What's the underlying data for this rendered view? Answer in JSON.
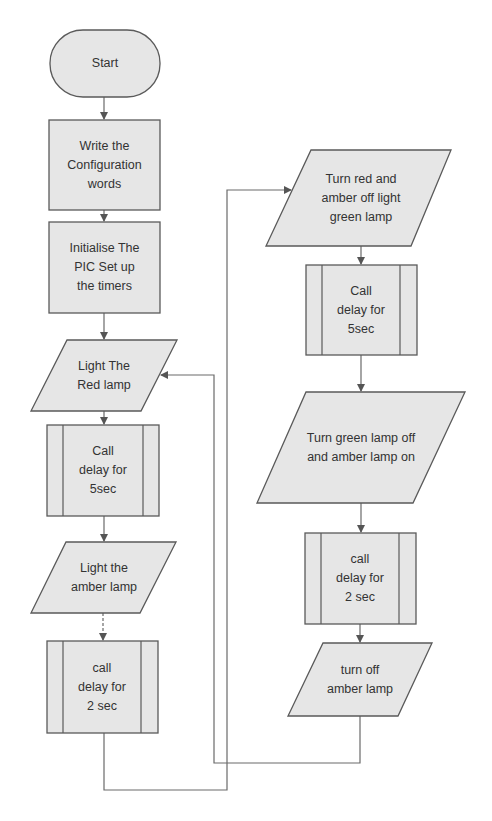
{
  "diagram": {
    "type": "flowchart",
    "colors": {
      "node_fill": "#e6e6e6",
      "node_stroke": "#5a5a5a",
      "connector": "#6a6a6a",
      "text": "#333333",
      "background": "#ffffff"
    },
    "nodes": {
      "start": {
        "shape": "terminal",
        "label": "Start"
      },
      "write_config": {
        "shape": "process",
        "label": "Write the\nConfiguration\nwords"
      },
      "init_pic": {
        "shape": "process",
        "label": "Initialise The\nPIC Set up\nthe timers"
      },
      "light_red": {
        "shape": "io",
        "label": "Light The\nRed lamp"
      },
      "delay_5_left": {
        "shape": "subroutine",
        "label": "Call\ndelay for\n5sec"
      },
      "light_amber": {
        "shape": "io",
        "label": "Light the\namber lamp"
      },
      "delay_2_left": {
        "shape": "subroutine",
        "label": "call\ndelay for\n2 sec"
      },
      "light_green": {
        "shape": "io",
        "label": "Turn red and\namber off light\ngreen lamp"
      },
      "delay_5_right": {
        "shape": "subroutine",
        "label": "Call\ndelay for\n5sec"
      },
      "green_off_amber_on": {
        "shape": "io",
        "label": "Turn green lamp off\nand amber lamp on"
      },
      "delay_2_right": {
        "shape": "subroutine",
        "label": "call\ndelay for\n2 sec"
      },
      "amber_off": {
        "shape": "io",
        "label": "turn off\namber lamp"
      }
    },
    "edges": [
      {
        "from": "start",
        "to": "write_config"
      },
      {
        "from": "write_config",
        "to": "init_pic"
      },
      {
        "from": "init_pic",
        "to": "light_red"
      },
      {
        "from": "light_red",
        "to": "delay_5_left"
      },
      {
        "from": "delay_5_left",
        "to": "light_amber"
      },
      {
        "from": "light_amber",
        "to": "delay_2_left"
      },
      {
        "from": "delay_2_left",
        "to": "light_green"
      },
      {
        "from": "light_green",
        "to": "delay_5_right"
      },
      {
        "from": "delay_5_right",
        "to": "green_off_amber_on"
      },
      {
        "from": "green_off_amber_on",
        "to": "delay_2_right"
      },
      {
        "from": "delay_2_right",
        "to": "amber_off"
      },
      {
        "from": "amber_off",
        "to": "light_red"
      }
    ]
  }
}
